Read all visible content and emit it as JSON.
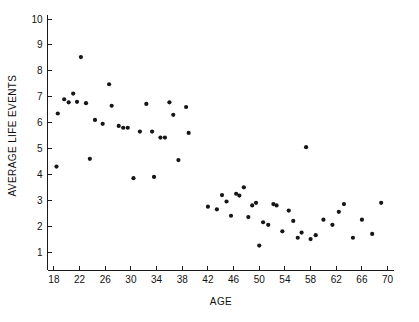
{
  "chart_data": {
    "type": "scatter",
    "title": "",
    "xlabel": "AGE",
    "ylabel": "AVERAGE LIFE EVENTS",
    "xlim": [
      17,
      71
    ],
    "ylim": [
      0.55,
      10.0
    ],
    "xticks": [
      18,
      22,
      26,
      30,
      34,
      38,
      42,
      46,
      50,
      54,
      58,
      62,
      66,
      70
    ],
    "yticks": [
      1,
      2,
      3,
      4,
      5,
      6,
      7,
      8,
      9,
      10
    ],
    "grid": false,
    "legend": null,
    "marker": "circle",
    "marker_color": "#16161a",
    "points": [
      [
        18.4,
        4.3
      ],
      [
        18.6,
        6.35
      ],
      [
        19.6,
        6.9
      ],
      [
        20.3,
        6.78
      ],
      [
        21.0,
        7.12
      ],
      [
        21.6,
        6.8
      ],
      [
        22.2,
        8.53
      ],
      [
        23.0,
        6.75
      ],
      [
        23.6,
        4.6
      ],
      [
        24.4,
        6.1
      ],
      [
        25.6,
        5.95
      ],
      [
        26.6,
        7.48
      ],
      [
        27.0,
        6.65
      ],
      [
        28.1,
        5.87
      ],
      [
        28.8,
        5.8
      ],
      [
        29.5,
        5.8
      ],
      [
        30.4,
        3.85
      ],
      [
        31.4,
        5.65
      ],
      [
        32.4,
        6.72
      ],
      [
        33.3,
        5.65
      ],
      [
        33.6,
        3.9
      ],
      [
        34.6,
        5.42
      ],
      [
        35.3,
        5.42
      ],
      [
        36.0,
        6.78
      ],
      [
        36.6,
        6.3
      ],
      [
        37.4,
        4.55
      ],
      [
        38.6,
        6.6
      ],
      [
        39.0,
        5.6
      ],
      [
        42.0,
        2.75
      ],
      [
        43.4,
        2.65
      ],
      [
        44.2,
        3.2
      ],
      [
        44.9,
        2.95
      ],
      [
        45.6,
        2.4
      ],
      [
        46.4,
        3.25
      ],
      [
        46.9,
        3.18
      ],
      [
        47.6,
        3.5
      ],
      [
        48.3,
        2.35
      ],
      [
        48.9,
        2.8
      ],
      [
        49.5,
        2.9
      ],
      [
        50.0,
        1.25
      ],
      [
        50.6,
        2.15
      ],
      [
        51.4,
        2.05
      ],
      [
        52.2,
        2.85
      ],
      [
        52.7,
        2.8
      ],
      [
        53.6,
        1.8
      ],
      [
        54.6,
        2.6
      ],
      [
        55.3,
        2.2
      ],
      [
        56.0,
        1.55
      ],
      [
        56.6,
        1.75
      ],
      [
        57.3,
        5.05
      ],
      [
        58.0,
        1.5
      ],
      [
        58.8,
        1.65
      ],
      [
        60.0,
        2.25
      ],
      [
        61.4,
        2.05
      ],
      [
        62.4,
        2.55
      ],
      [
        63.2,
        2.85
      ],
      [
        64.6,
        1.55
      ],
      [
        66.0,
        2.25
      ],
      [
        67.6,
        1.7
      ],
      [
        69.0,
        2.9
      ]
    ]
  }
}
